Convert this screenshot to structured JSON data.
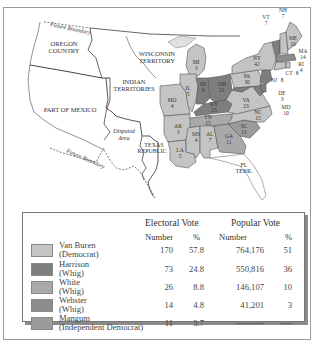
{
  "map": {
    "labels": {
      "future_boundary_north": "Future Boundary",
      "future_boundary_south": "Future Boundary",
      "oregon_country": [
        "OREGON",
        "COUNTRY"
      ],
      "wisconsin_territory": [
        "WISCONSIN",
        "TERRITORY"
      ],
      "indian_territories": [
        "INDIAN",
        "TERRITORIES"
      ],
      "part_of_mexico": "PART OF MEXICO",
      "disputed_area": [
        "Disputed",
        "Area"
      ],
      "texas_republic": [
        "TEXAS",
        "REPUBLIC"
      ],
      "florida_terr": [
        "FL",
        "TERR."
      ]
    },
    "states": [
      {
        "abbr": "ME",
        "votes": "10",
        "winner": "Van Buren"
      },
      {
        "abbr": "NH",
        "votes": "7",
        "winner": "Van Buren"
      },
      {
        "abbr": "VT",
        "votes": "7",
        "winner": "Harrison"
      },
      {
        "abbr": "MA",
        "votes": "14",
        "winner": "Webster"
      },
      {
        "abbr": "RI",
        "votes": "4",
        "winner": "Van Buren"
      },
      {
        "abbr": "CT",
        "votes": "8",
        "winner": "Van Buren"
      },
      {
        "abbr": "NY",
        "votes": "42",
        "winner": "Van Buren"
      },
      {
        "abbr": "NJ",
        "votes": "8",
        "winner": "Harrison"
      },
      {
        "abbr": "DE",
        "votes": "3",
        "winner": "Harrison"
      },
      {
        "abbr": "MD",
        "votes": "10",
        "winner": "Harrison"
      },
      {
        "abbr": "PA",
        "votes": "30",
        "winner": "Van Buren"
      },
      {
        "abbr": "VA",
        "votes": "23",
        "winner": "Van Buren"
      },
      {
        "abbr": "NC",
        "votes": "15",
        "winner": "Van Buren"
      },
      {
        "abbr": "SC",
        "votes": "11",
        "winner": "Mangum"
      },
      {
        "abbr": "GA",
        "votes": "11",
        "winner": "White"
      },
      {
        "abbr": "AL",
        "votes": "7",
        "winner": "Van Buren"
      },
      {
        "abbr": "MS",
        "votes": "4",
        "winner": "Van Buren"
      },
      {
        "abbr": "LA",
        "votes": "5",
        "winner": "Van Buren"
      },
      {
        "abbr": "TN",
        "votes": "15",
        "winner": "White"
      },
      {
        "abbr": "KY",
        "votes": "15",
        "winner": "Harrison"
      },
      {
        "abbr": "OH",
        "votes": "21",
        "winner": "Harrison"
      },
      {
        "abbr": "IN",
        "votes": "9",
        "winner": "Harrison"
      },
      {
        "abbr": "IL",
        "votes": "5",
        "winner": "Van Buren"
      },
      {
        "abbr": "MI",
        "votes": "3",
        "winner": "Van Buren"
      },
      {
        "abbr": "MO",
        "votes": "4",
        "winner": "Van Buren"
      },
      {
        "abbr": "AR",
        "votes": "3",
        "winner": "Van Buren"
      }
    ]
  },
  "legend": {
    "headers": {
      "electoral_vote": "Electoral Vote",
      "popular_vote": "Popular Vote",
      "number": "Number",
      "percent": "%"
    },
    "rows": [
      {
        "name": "Van Buren",
        "party": "(Democrat)",
        "ev_number": "170",
        "ev_percent": "57.8",
        "pv_number": "764,176",
        "pv_percent": "51",
        "color": "#c4c4c4"
      },
      {
        "name": "Harrison",
        "party": "(Whig)",
        "ev_number": "73",
        "ev_percent": "24.8",
        "pv_number": "550,816",
        "pv_percent": "36",
        "color": "#7e7e7e"
      },
      {
        "name": "White",
        "party": "(Whig)",
        "ev_number": "26",
        "ev_percent": "8.8",
        "pv_number": "146,107",
        "pv_percent": "10",
        "color": "#a9a9a9"
      },
      {
        "name": "Webster",
        "party": "(Whig)",
        "ev_number": "14",
        "ev_percent": "4.8",
        "pv_number": "41,201",
        "pv_percent": "3",
        "color": "#8d8d8d"
      },
      {
        "name": "Mangum",
        "party": "(Independent Democrat)",
        "ev_number": "11",
        "ev_percent": "3.7",
        "pv_number": "----------",
        "pv_percent": "----",
        "color": "#9b9b9b"
      }
    ]
  },
  "colors": {
    "van_buren": "#c4c4c4",
    "harrison": "#7e7e7e",
    "white": "#a9a9a9",
    "webster": "#8d8d8d",
    "mangum": "#9b9b9b",
    "border": "#555555",
    "territory": "#ffffff"
  }
}
